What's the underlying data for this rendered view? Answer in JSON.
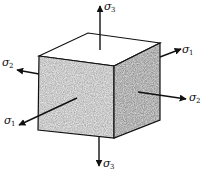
{
  "diagram": {
    "colors": {
      "background": "#ffffff",
      "stroke": "#111111",
      "front_face": "#e2e2e2",
      "right_face": "#cfcfcf",
      "top_face": "#ffffff"
    },
    "labels": {
      "sigma3_top": {
        "symbol": "σ",
        "sub": "3"
      },
      "sigma3_bottom": {
        "symbol": "σ",
        "sub": "3"
      },
      "sigma2_left": {
        "symbol": "σ",
        "sub": "2"
      },
      "sigma2_right": {
        "symbol": "σ",
        "sub": "2"
      },
      "sigma1_front": {
        "symbol": "σ",
        "sub": "1"
      },
      "sigma1_back": {
        "symbol": "σ",
        "sub": "1"
      }
    }
  }
}
